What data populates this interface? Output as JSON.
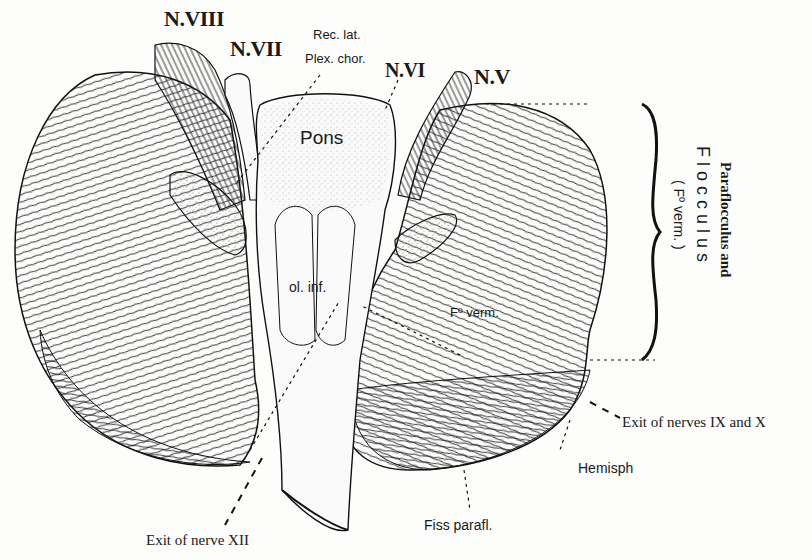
{
  "figure": {
    "nerve_labels": [
      {
        "id": "n8",
        "text": "N.VIII"
      },
      {
        "id": "n7",
        "text": "N.VII"
      },
      {
        "id": "n6",
        "text": "N.VI"
      },
      {
        "id": "n5",
        "text": "N.V"
      }
    ],
    "structure_labels": {
      "rec_lat": "Rec. lat.",
      "plex_chor": "Plex. chor.",
      "pons": "Pons",
      "ol_inf": "ol. inf.",
      "fo_verm": "Fº verm.",
      "hemisph": "Hemisph",
      "fiss_parafl": "Fiss parafl."
    },
    "bracket_labels": {
      "paraflocculus": "Paraflocculus and",
      "flocculus": "F l o c c u l u s",
      "fo_verm_paren": "( Fº verm. )"
    },
    "exit_labels": {
      "nerves_ix_x": "Exit of nerves IX and X",
      "nerve_xii": "Exit of nerve XII"
    },
    "colors": {
      "ink": "#1a1a1a",
      "paper": "#fdfdfc",
      "stipple": "#555555"
    }
  }
}
